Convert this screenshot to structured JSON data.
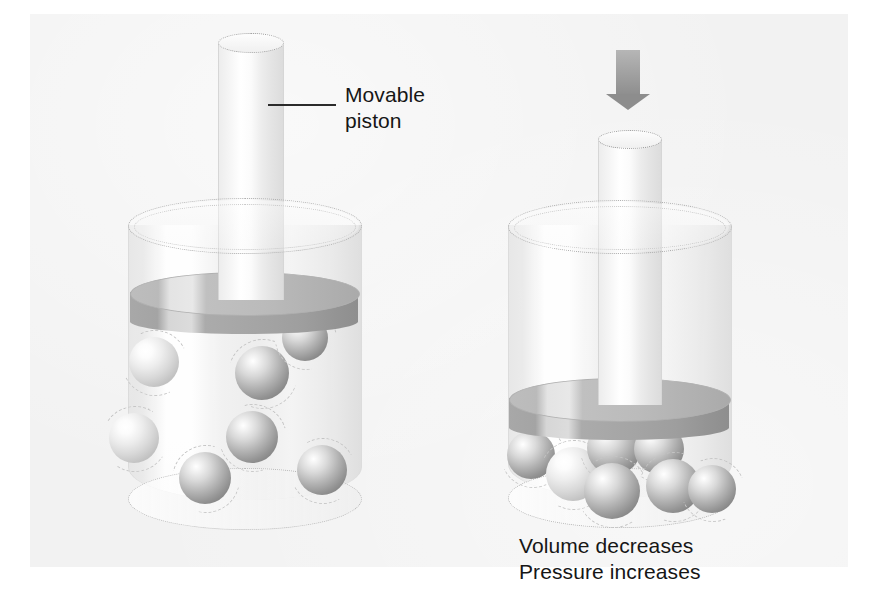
{
  "figure": {
    "title_alt": "Gas compression in a cylinder with a movable piston",
    "background_color": "#ffffff",
    "plate_color": "#f2f2f2"
  },
  "labels": {
    "piston_label": "Movable\npiston",
    "result_label": "Volume decreases\nPressure increases"
  },
  "icons": {
    "pressure_arrow": "down-arrow-icon",
    "leader_line": "leader-line"
  },
  "panels": [
    {
      "id": "left",
      "name": "uncompressed-gas-panel",
      "state": "expanded",
      "molecule_count": 8,
      "piston_position": "raised",
      "molecules": [
        {
          "x": 154,
          "y": 362,
          "r": 25,
          "shade": "pale"
        },
        {
          "x": 262,
          "y": 373,
          "r": 27,
          "shade": "dark"
        },
        {
          "x": 305,
          "y": 338,
          "r": 23,
          "shade": "dark"
        },
        {
          "x": 134,
          "y": 438,
          "r": 25,
          "shade": "pale"
        },
        {
          "x": 252,
          "y": 437,
          "r": 26,
          "shade": "dark"
        },
        {
          "x": 205,
          "y": 478,
          "r": 26,
          "shade": "dark"
        },
        {
          "x": 322,
          "y": 470,
          "r": 25,
          "shade": "dark"
        }
      ]
    },
    {
      "id": "right",
      "name": "compressed-gas-panel",
      "state": "compressed",
      "molecule_count": 8,
      "piston_position": "lowered",
      "molecules": [
        {
          "x": 531,
          "y": 456,
          "r": 24,
          "shade": "dark"
        },
        {
          "x": 572,
          "y": 474,
          "r": 26,
          "shade": "pale"
        },
        {
          "x": 613,
          "y": 447,
          "r": 26,
          "shade": "dark"
        },
        {
          "x": 659,
          "y": 449,
          "r": 25,
          "shade": "dark"
        },
        {
          "x": 611,
          "y": 490,
          "r": 27,
          "shade": "dark"
        },
        {
          "x": 672,
          "y": 485,
          "r": 26,
          "shade": "dark"
        },
        {
          "x": 712,
          "y": 489,
          "r": 24,
          "shade": "dark"
        }
      ]
    }
  ],
  "colors": {
    "molecule_dark": "#949494",
    "molecule_light": "#d8d8d8",
    "piston_disc": "#b5b5b5",
    "arrow": "#9a9a9a",
    "text": "#161616"
  }
}
